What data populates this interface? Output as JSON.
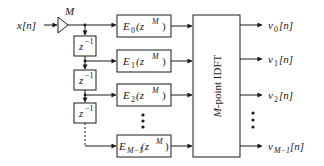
{
  "diagram": {
    "input": {
      "label": "x[n]"
    },
    "gain": {
      "label": "M"
    },
    "delays": [
      {
        "label": "z",
        "exp": "−1"
      },
      {
        "label": "z",
        "exp": "−1"
      },
      {
        "label": "z",
        "exp": "−1"
      }
    ],
    "filters": [
      {
        "base": "E",
        "sub": "0",
        "arg": "(z",
        "argexp": "M",
        "close": ")"
      },
      {
        "base": "E",
        "sub": "1",
        "arg": "(z",
        "argexp": "M",
        "close": ")"
      },
      {
        "base": "E",
        "sub": "2",
        "arg": "(z",
        "argexp": "M",
        "close": ")"
      },
      {
        "base": "E",
        "sub": "M−1",
        "arg": "(z",
        "argexp": "M",
        "close": ")"
      }
    ],
    "idft": {
      "prefix": "M",
      "label": "-point IDFT"
    },
    "outputs": [
      {
        "base": "v",
        "sub": "0",
        "suffix": "[n]"
      },
      {
        "base": "v",
        "sub": "1",
        "suffix": "[n]"
      },
      {
        "base": "v",
        "sub": "2",
        "suffix": "[n]"
      },
      {
        "base": "v",
        "sub": "M−1",
        "suffix": "[n]"
      }
    ],
    "ellipsis": "⋮",
    "colors": {
      "stroke": "#1a1a1a",
      "background": "#ffffff"
    }
  }
}
